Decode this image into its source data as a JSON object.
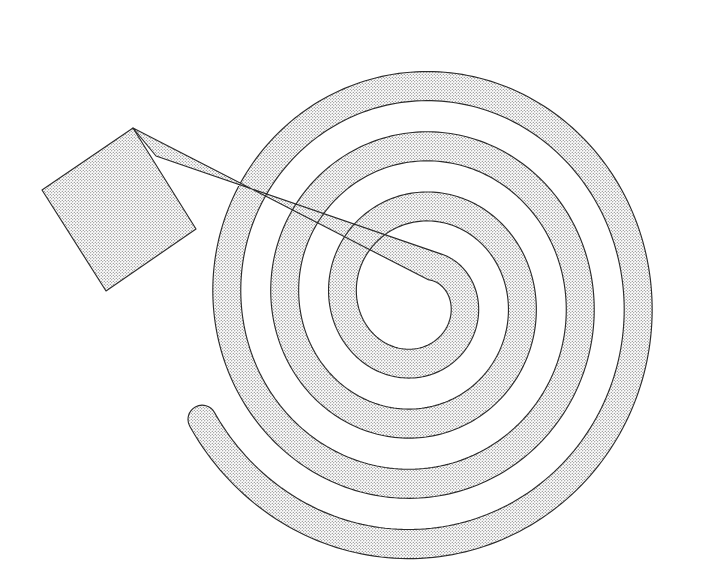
{
  "figure": {
    "type": "line-art-diagram",
    "canvas": {
      "width": 703,
      "height": 565,
      "background": "#ffffff"
    },
    "style": {
      "outline_color": "#2b2b2b",
      "outline_width": 1.15,
      "fill_style": "stipple-dot-screen",
      "fill_dot_color": "#5a5a5a",
      "fill_background": "#ffffff",
      "fill_dot_spacing_px": 3,
      "fill_dot_radius_px": 0.55
    },
    "spiral": {
      "shape": "archimedean-band",
      "center_x": 418,
      "center_y": 300,
      "turns": 3.6,
      "band_width": 28,
      "start_radius": 36,
      "radius_growth_per_turn": 58,
      "start_angle_deg": 62,
      "end_angle_deg": -1232,
      "x_scale": 1.0,
      "y_scale": 1.04,
      "outer_extent_left": 205,
      "outer_extent_right": 672,
      "outer_extent_top": 28,
      "outer_extent_bottom": 538,
      "inner_terminal_blob": {
        "cx": 419,
        "cy": 303,
        "r": 36
      }
    },
    "tag": {
      "shape": "rotated-square-flag",
      "corners": [
        {
          "x": 133,
          "y": 128
        },
        {
          "x": 196,
          "y": 229
        },
        {
          "x": 106,
          "y": 291
        },
        {
          "x": 42,
          "y": 190
        }
      ],
      "notch_vertex": {
        "x": 156,
        "y": 156
      },
      "attached_to": "spiral-outer-end"
    }
  }
}
